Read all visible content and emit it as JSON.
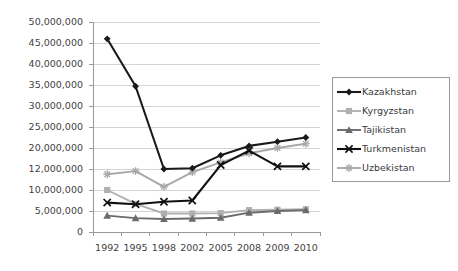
{
  "chart_data": {
    "type": "line",
    "title": "",
    "subtitle": "",
    "xlabel": "",
    "ylabel": "",
    "categories": [
      "1992",
      "1995",
      "1998",
      "2002",
      "2005",
      "2008",
      "2009",
      "2010"
    ],
    "grid": true,
    "legend_position": "right",
    "y_tick_labels": [
      "50,000,000",
      "45,000,000",
      "40,000,000",
      "35,000,000",
      "30,000,000",
      "25,000,000",
      "20,000,000",
      "12,000,000",
      "10,000,000",
      "5,000,000",
      "0"
    ],
    "y_tick_values": [
      50000000,
      45000000,
      40000000,
      35000000,
      30000000,
      25000000,
      20000000,
      12000000,
      10000000,
      5000000,
      0
    ],
    "ylim": [
      0,
      50000000
    ],
    "series": [
      {
        "name": "Kazakhstan",
        "color": "#1a1a1a",
        "marker": "diamond",
        "values": [
          46000000,
          34700000,
          12000000,
          12300000,
          17200000,
          20500000,
          21500000,
          22500000
        ]
      },
      {
        "name": "Kyrgyzstan",
        "color": "#b0b0b0",
        "marker": "square",
        "values": [
          10000000,
          6700000,
          4400000,
          4400000,
          4500000,
          5200000,
          5300000,
          5400000
        ]
      },
      {
        "name": "Tajikistan",
        "color": "#6b6b6b",
        "marker": "triangle",
        "values": [
          3900000,
          3300000,
          3100000,
          3200000,
          3400000,
          4600000,
          5000000,
          5200000
        ]
      },
      {
        "name": "Turkmenistan",
        "color": "#111111",
        "marker": "cross",
        "values": [
          7000000,
          6600000,
          7200000,
          7500000,
          13500000,
          19000000,
          13000000,
          13000000
        ]
      },
      {
        "name": "Uzbekistan",
        "color": "#a8a8a8",
        "marker": "plus",
        "values": [
          11500000,
          11800000,
          10300000,
          11700000,
          14500000,
          18000000,
          20000000,
          21000000
        ]
      }
    ]
  },
  "legend": {
    "items": [
      {
        "label": "Kazakhstan"
      },
      {
        "label": "Kyrgyzstan"
      },
      {
        "label": "Tajikistan"
      },
      {
        "label": "Turkmenistan"
      },
      {
        "label": "Uzbekistan"
      }
    ]
  },
  "colors": {
    "background": "#ffffff",
    "grid": "#d4d4d4",
    "axis": "#9a9a9a",
    "text": "#3a3a3a"
  }
}
